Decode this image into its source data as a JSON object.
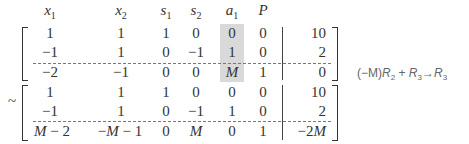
{
  "headers": [
    {
      "var": "x",
      "sub": "1",
      "x": 50
    },
    {
      "var": "x",
      "sub": "2",
      "x": 121
    },
    {
      "var": "s",
      "sub": "1",
      "x": 166
    },
    {
      "var": "s",
      "sub": "2",
      "x": 196
    },
    {
      "var": "a",
      "sub": "1",
      "x": 232
    },
    {
      "var": "P",
      "sub": "",
      "x": 263
    }
  ],
  "top_matrix": {
    "rows": [
      [
        "1",
        "1",
        "1",
        "0",
        "0",
        "0",
        "10"
      ],
      [
        "−1",
        "1",
        "0",
        "−1",
        "1",
        "0",
        "2"
      ],
      [
        "−2",
        "−1",
        "0",
        "0",
        "M",
        "1",
        "0"
      ]
    ]
  },
  "bottom_matrix": {
    "prefix": "~",
    "rows": [
      [
        "1",
        "1",
        "1",
        "0",
        "0",
        "0",
        "10"
      ],
      [
        "−1",
        "1",
        "0",
        "−1",
        "1",
        "0",
        "2"
      ],
      [
        "M − 2",
        "−M − 1",
        "0",
        "M",
        "0",
        "1",
        "−2M"
      ]
    ]
  },
  "highlighted_column": "a1",
  "row_operation": {
    "coef": "(−M)",
    "r_a": "R",
    "r_a_sub": "2",
    "plus": "+",
    "r_b": "R",
    "r_b_sub": "3",
    "arrow": "→",
    "r_c": "R",
    "r_c_sub": "3"
  }
}
